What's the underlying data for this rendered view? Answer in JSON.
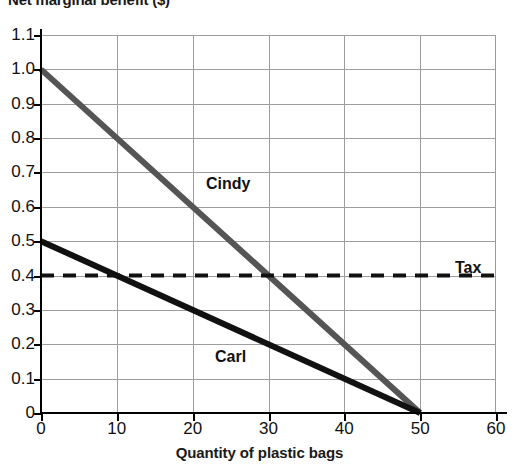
{
  "chart_data": {
    "type": "line",
    "title": "Net marginal benefit ($)",
    "xlabel": "Quantity of plastic bags",
    "ylabel": "Net marginal benefit ($)",
    "xlim": [
      0,
      60
    ],
    "ylim": [
      0,
      1.1
    ],
    "xticks": [
      "0",
      "10",
      "20",
      "30",
      "40",
      "50",
      "60"
    ],
    "xtick_values": [
      0,
      10,
      20,
      30,
      40,
      50,
      60
    ],
    "yticks": [
      "0",
      "0.1",
      "0.2",
      "0.3",
      "0.4",
      "0.5",
      "0.6",
      "0.7",
      "0.8",
      "0.9",
      "1.0",
      "1.1"
    ],
    "ytick_values": [
      0,
      0.1,
      0.2,
      0.3,
      0.4,
      0.5,
      0.6,
      0.7,
      0.8,
      0.9,
      1.0,
      1.1
    ],
    "grid": true,
    "legend_position": "inline-annotations",
    "series": [
      {
        "name": "Cindy",
        "style": "solid",
        "color": "#555555",
        "x": [
          0,
          50
        ],
        "values": [
          1.0,
          0.0
        ],
        "label": "Cindy"
      },
      {
        "name": "Carl",
        "style": "solid",
        "color": "#111111",
        "x": [
          0,
          50
        ],
        "values": [
          0.5,
          0.0
        ],
        "label": "Carl"
      },
      {
        "name": "Tax",
        "style": "dashed",
        "color": "#111111",
        "x": [
          0,
          60
        ],
        "values": [
          0.4,
          0.4
        ],
        "label": "Tax"
      }
    ],
    "annotations": [
      {
        "text": "Cindy",
        "x": 22,
        "y": 0.63
      },
      {
        "text": "Carl",
        "x": 23,
        "y": 0.175
      },
      {
        "text": "Tax",
        "x": 55,
        "y": 0.4
      }
    ],
    "intersections": [
      {
        "series": "Carl",
        "with": "Tax",
        "x": 10,
        "y": 0.4
      },
      {
        "series": "Cindy",
        "with": "Tax",
        "x": 30,
        "y": 0.4
      },
      {
        "series": "Cindy",
        "with": "Carl",
        "x": 50,
        "y": 0.0
      }
    ]
  }
}
